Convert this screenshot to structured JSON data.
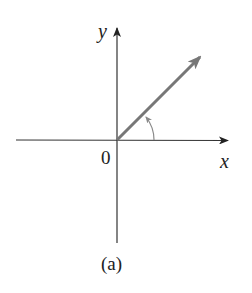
{
  "figure": {
    "caption": "(a)",
    "origin_label": "0",
    "x_axis_label": "x",
    "y_axis_label": "y",
    "axis_color": "#333333",
    "vector_color": "#777777",
    "arc_color": "#8a8a8a",
    "vector_angle_deg": 45
  }
}
